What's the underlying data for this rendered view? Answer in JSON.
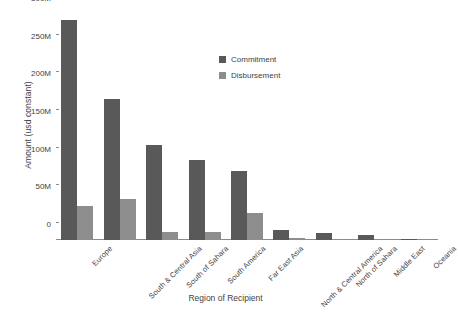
{
  "chart_data": {
    "type": "bar",
    "title": "",
    "xlabel": "Region of Recipient",
    "ylabel": "Amount (usd constant)",
    "categories": [
      "Europe",
      "South & Central Asia",
      "South of Sahara",
      "South America",
      "Far East Asia",
      "North & Central America",
      "North of Sahara",
      "Middle East",
      "Oceania"
    ],
    "series": [
      {
        "name": "Commitment",
        "color": "#595959",
        "values": [
          292000000,
          187000000,
          126000000,
          106000000,
          91000000,
          13000000,
          9000000,
          7000000,
          1500000
        ]
      },
      {
        "name": "Disbursement",
        "color": "#8d8d8d",
        "values": [
          45000000,
          54000000,
          11000000,
          10000000,
          36000000,
          3000000,
          2000000,
          1500000,
          600000
        ]
      }
    ],
    "ylim": [
      0,
      300000000
    ],
    "yticks": [
      0,
      50000000,
      100000000,
      150000000,
      200000000,
      250000000,
      300000000
    ],
    "ytick_labels": [
      "0",
      "50M",
      "100M",
      "150M",
      "200M",
      "250M",
      "300M"
    ],
    "grid": false,
    "legend_position": "upper-center"
  }
}
